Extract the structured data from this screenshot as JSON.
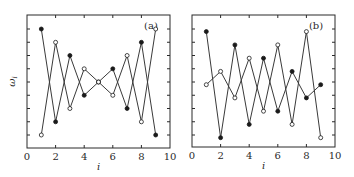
{
  "figure": {
    "panels": [
      "(a)",
      "(b)"
    ]
  },
  "chart_data": [
    {
      "type": "line",
      "panel_label": "(a)",
      "title": "",
      "xlabel": "i",
      "ylabel": "ω_i",
      "xlim": [
        0,
        10
      ],
      "xticks": [
        0,
        2,
        4,
        6,
        8,
        10
      ],
      "ytick_count": 9,
      "y_units": "arbitrary (tick levels 1-9, no numeric labels)",
      "grid": false,
      "legend": "none",
      "x": [
        1,
        2,
        3,
        4,
        5,
        6,
        7,
        8,
        9
      ],
      "series": [
        {
          "name": "filled",
          "marker": "filled-circle",
          "values": [
            9,
            2,
            7,
            4,
            5,
            6,
            3,
            8,
            1
          ]
        },
        {
          "name": "open",
          "marker": "open-circle",
          "values": [
            1,
            8,
            3,
            6,
            5,
            4,
            7,
            2,
            9
          ]
        }
      ]
    },
    {
      "type": "line",
      "panel_label": "(b)",
      "title": "",
      "xlabel": "i",
      "ylabel": "",
      "xlim": [
        0,
        10
      ],
      "xticks": [
        0,
        2,
        4,
        6,
        8,
        10
      ],
      "ytick_count": 9,
      "y_units": "arbitrary (tick levels 1-9, no numeric labels)",
      "grid": false,
      "legend": "none",
      "x": [
        1,
        2,
        3,
        4,
        5,
        6,
        7,
        8,
        9
      ],
      "series": [
        {
          "name": "filled",
          "marker": "filled-circle",
          "values": [
            8.8,
            0.8,
            7.8,
            1.8,
            6.8,
            2.8,
            5.8,
            3.8,
            4.8
          ]
        },
        {
          "name": "open",
          "marker": "open-circle",
          "values": [
            4.8,
            5.8,
            3.8,
            6.8,
            2.8,
            7.8,
            1.8,
            8.8,
            0.8
          ]
        }
      ]
    }
  ],
  "style": {
    "line_color": "#3a3a3a",
    "marker_color": "#1a1a1a",
    "frame_color": "#2a2a2a",
    "background": "#ffffff"
  }
}
